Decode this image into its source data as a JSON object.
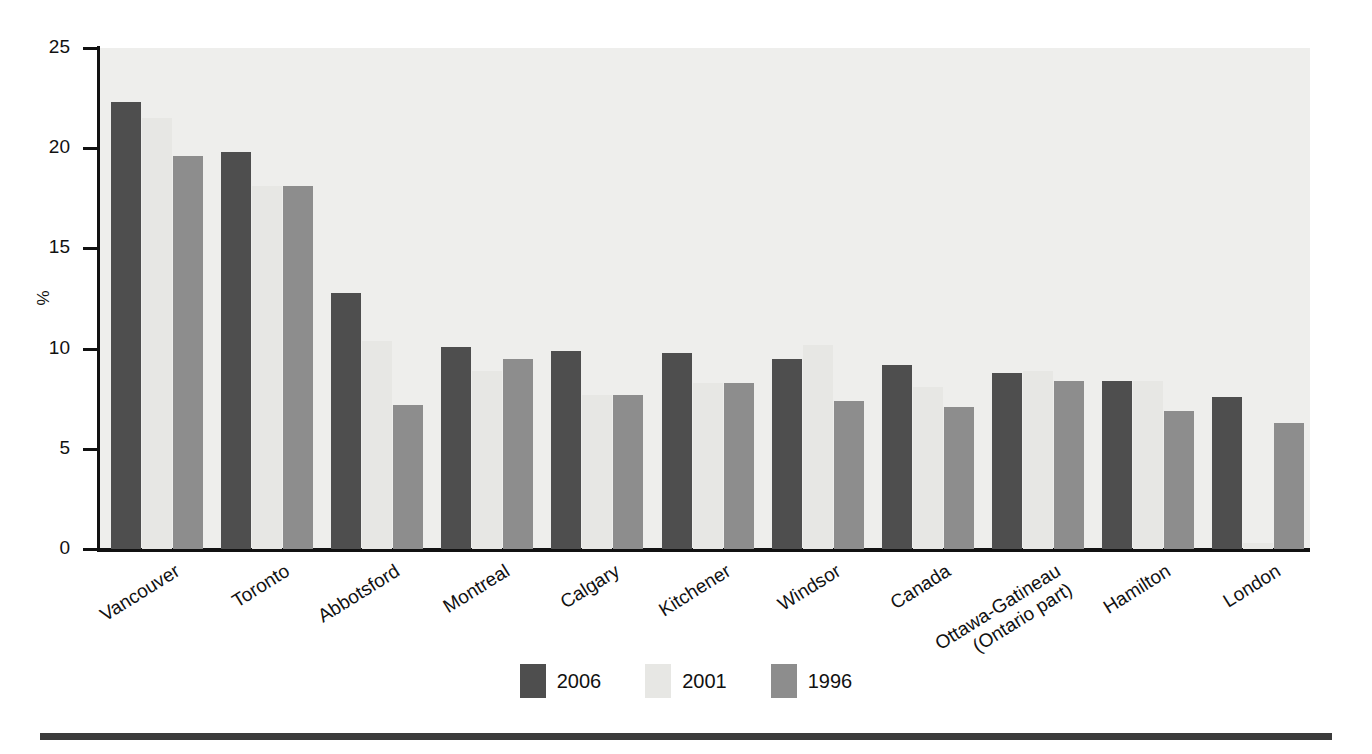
{
  "chart_data": {
    "type": "bar",
    "title": "",
    "subtitle": "",
    "xlabel": "",
    "ylabel": "%",
    "ylim": [
      0,
      25
    ],
    "yticks": [
      0,
      5,
      10,
      15,
      20,
      25
    ],
    "grid": false,
    "legend_position": "bottom-center",
    "categories": [
      "Vancouver",
      "Toronto",
      "Abbotsford",
      "Montreal",
      "Calgary",
      "Kitchener",
      "Windsor",
      "Canada",
      "Ottawa-Gatineau (Ontario part)",
      "Hamilton",
      "London"
    ],
    "category_lines": [
      [
        "Vancouver"
      ],
      [
        "Toronto"
      ],
      [
        "Abbotsford"
      ],
      [
        "Montreal"
      ],
      [
        "Calgary"
      ],
      [
        "Kitchener"
      ],
      [
        "Windsor"
      ],
      [
        "Canada"
      ],
      [
        "Ottawa-Gatineau",
        "(Ontario part)"
      ],
      [
        "Hamilton"
      ],
      [
        "London"
      ]
    ],
    "series": [
      {
        "name": "2006",
        "color": "#4e4e4e",
        "values": [
          22.3,
          19.8,
          12.8,
          10.1,
          9.9,
          9.8,
          9.5,
          9.2,
          8.8,
          8.4,
          7.6
        ]
      },
      {
        "name": "2001",
        "color": "#e7e7e4",
        "values": [
          21.5,
          18.1,
          10.4,
          8.9,
          7.7,
          8.3,
          10.2,
          8.1,
          8.9,
          8.4,
          0.3
        ]
      },
      {
        "name": "1996",
        "color": "#8d8d8d",
        "values": [
          19.6,
          18.1,
          7.2,
          9.5,
          7.7,
          8.3,
          7.4,
          7.1,
          8.4,
          6.9,
          6.3
        ]
      }
    ]
  },
  "legend": {
    "items": [
      {
        "label": "2006",
        "color": "#4e4e4e"
      },
      {
        "label": "2001",
        "color": "#e7e7e4"
      },
      {
        "label": "1996",
        "color": "#8d8d8d"
      }
    ]
  },
  "footer": {
    "text": ""
  }
}
